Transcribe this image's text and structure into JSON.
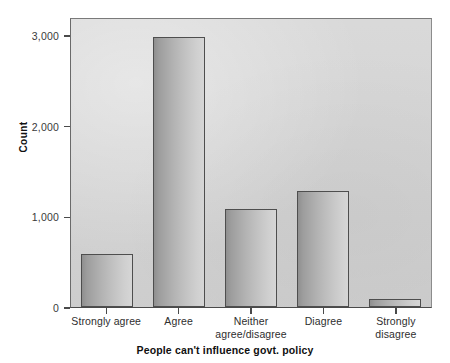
{
  "chart_data": {
    "type": "bar",
    "title": "",
    "subtitle": "",
    "xlabel": "People can't influence govt. policy",
    "ylabel": "Count",
    "categories": [
      "Strongly agree",
      "Agree",
      "Neither agree/disagree",
      "Diagree",
      "Strongly disagree"
    ],
    "category_lines": [
      [
        "Strongly agree"
      ],
      [
        "Agree"
      ],
      [
        "Neither",
        "agree/disagree"
      ],
      [
        "Diagree"
      ],
      [
        "Strongly disagree"
      ]
    ],
    "values": [
      580,
      2975,
      1080,
      1275,
      85
    ],
    "ylim": [
      0,
      3200
    ],
    "xlim_note": "categorical",
    "yticks": [
      0,
      1000,
      2000,
      3000
    ],
    "ytick_labels": [
      "0",
      "1,000",
      "2,000",
      "3,000"
    ],
    "grid": false,
    "legend": false,
    "legend_position": "none",
    "bar_fill_start": "#8f8f8f",
    "bar_fill_end": "#d6d6d6",
    "bar_border_color": "#4e4e4e",
    "plot_background": "#d4d4d4",
    "page_background": "#ffffff",
    "axis_color": "#4a4a4a",
    "text_color": "#2e2e2e"
  },
  "axes": {
    "y": {
      "title": "Count",
      "ticks": [
        {
          "label": "3,000",
          "value": 3000
        },
        {
          "label": "2,000",
          "value": 2000
        },
        {
          "label": "1,000",
          "value": 1000
        },
        {
          "label": "0",
          "value": 0
        }
      ]
    },
    "x": {
      "title": "People can't influence govt. policy"
    }
  }
}
